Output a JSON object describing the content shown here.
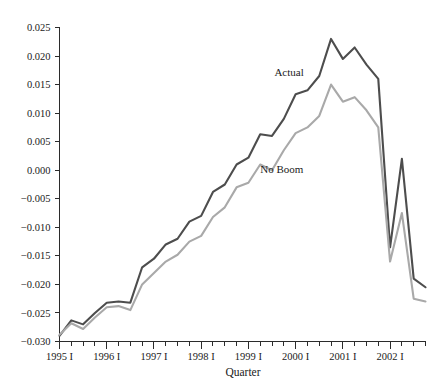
{
  "chart_data": {
    "type": "line",
    "title": "",
    "xlabel": "Quarter",
    "ylabel": "",
    "grid": false,
    "legend_position": "inline-annotation",
    "ylim": [
      -0.03,
      0.025
    ],
    "ytick_labels": [
      "0.025",
      "0.020",
      "0.015",
      "0.010",
      "0.005",
      "0.000",
      "-0.005",
      "-0.010",
      "-0.015",
      "-0.020",
      "-0.025",
      "-0.030"
    ],
    "ytick_values": [
      0.025,
      0.02,
      0.015,
      0.01,
      0.005,
      0.0,
      -0.005,
      -0.01,
      -0.015,
      -0.02,
      -0.025,
      -0.03
    ],
    "xtick_labels": [
      "1995 I",
      "1996 I",
      "1997 I",
      "1998 I",
      "1999 I",
      "2000 I",
      "2001 I",
      "2002 I"
    ],
    "xtick_major_index": [
      0,
      4,
      8,
      12,
      16,
      20,
      24,
      28
    ],
    "x": [
      "1995 I",
      "1995 II",
      "1995 III",
      "1995 IV",
      "1996 I",
      "1996 II",
      "1996 III",
      "1996 IV",
      "1997 I",
      "1997 II",
      "1997 III",
      "1997 IV",
      "1998 I",
      "1998 II",
      "1998 III",
      "1998 IV",
      "1999 I",
      "1999 II",
      "1999 III",
      "1999 IV",
      "2000 I",
      "2000 II",
      "2000 III",
      "2000 IV",
      "2001 I",
      "2001 II",
      "2001 III",
      "2001 IV",
      "2002 I",
      "2002 II",
      "2002 III",
      "2002 IV"
    ],
    "series": [
      {
        "name": "Actual",
        "color": "#4d4d4d",
        "label_x_index": 18.2,
        "label_y_value": 0.0165,
        "values": [
          -0.029,
          -0.0263,
          -0.027,
          -0.025,
          -0.0232,
          -0.023,
          -0.0232,
          -0.017,
          -0.0155,
          -0.013,
          -0.012,
          -0.009,
          -0.008,
          -0.0038,
          -0.0025,
          0.001,
          0.0022,
          0.0063,
          0.006,
          0.009,
          0.0133,
          0.014,
          0.0165,
          0.023,
          0.0195,
          0.0215,
          0.0185,
          0.016,
          -0.0135,
          0.002,
          -0.019,
          -0.0205
        ]
      },
      {
        "name": "No Boom",
        "color": "#a9a9a9",
        "label_x_index": 17.0,
        "label_y_value": -0.0005,
        "values": [
          -0.0288,
          -0.0268,
          -0.0278,
          -0.0258,
          -0.024,
          -0.0238,
          -0.0245,
          -0.02,
          -0.018,
          -0.016,
          -0.0148,
          -0.0125,
          -0.0115,
          -0.0082,
          -0.0065,
          -0.003,
          -0.0022,
          0.001,
          0.0,
          0.0035,
          0.0065,
          0.0075,
          0.0095,
          0.015,
          0.012,
          0.0128,
          0.0105,
          0.0075,
          -0.016,
          -0.0075,
          -0.0225,
          -0.023
        ]
      }
    ]
  },
  "annotations": {
    "actual_label": "Actual",
    "noboom_label": "No Boom"
  }
}
